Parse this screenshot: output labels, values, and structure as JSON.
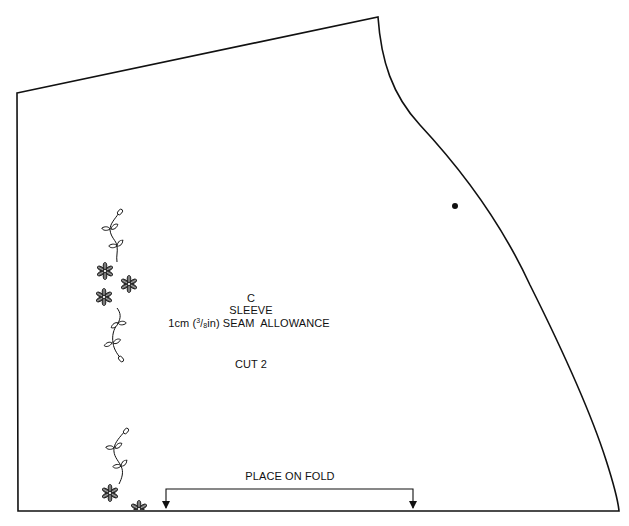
{
  "pattern_piece": {
    "piece_letter": "C",
    "piece_name": "SLEEVE",
    "seam_allowance": {
      "prefix": "1cm (",
      "frac_numerator": "3",
      "frac_slash": "/",
      "frac_denominator": "8",
      "suffix": "in) SEAM  ALLOWANCE",
      "full_text": "1cm (3/8in) SEAM  ALLOWANCE"
    },
    "cut_instruction": "CUT 2",
    "fold_instruction": "PLACE ON FOLD",
    "notch_marker": "dot"
  },
  "colors": {
    "line": "#111111",
    "background": "#ffffff"
  },
  "decorations": {
    "left_motif": "floral-vine-icon",
    "bottom_motif": "floral-vine-icon"
  }
}
